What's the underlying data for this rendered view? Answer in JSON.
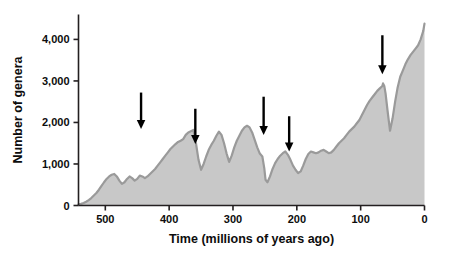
{
  "chart_data": {
    "type": "area",
    "title": "",
    "xlabel": "Time (millions of years ago)",
    "ylabel": "Number of genera",
    "xlim": [
      542,
      0
    ],
    "ylim": [
      0,
      4600
    ],
    "x_reversed": true,
    "grid": false,
    "legend": null,
    "x_ticks": [
      500,
      400,
      300,
      200,
      100,
      0
    ],
    "x_tick_labels": [
      "500",
      "400",
      "300",
      "200",
      "100",
      "0"
    ],
    "y_ticks": [
      0,
      1000,
      2000,
      3000,
      4000
    ],
    "y_tick_labels": [
      "0",
      "1,000",
      "2,000",
      "3,000",
      "4,000"
    ],
    "series_name": "Marine animal genera",
    "fill_color": "#c8c8c8",
    "line_color": "#9a9a9a",
    "axis_color": "#231f20",
    "arrow_color": "#000000",
    "x": [
      542,
      538,
      534,
      530,
      526,
      522,
      518,
      514,
      510,
      506,
      502,
      498,
      494,
      490,
      486,
      482,
      478,
      474,
      470,
      466,
      462,
      458,
      454,
      450,
      446,
      442,
      438,
      434,
      430,
      426,
      422,
      418,
      414,
      410,
      406,
      402,
      398,
      394,
      390,
      386,
      382,
      378,
      374,
      370,
      366,
      362,
      358,
      354,
      350,
      346,
      342,
      338,
      334,
      330,
      326,
      322,
      318,
      314,
      310,
      306,
      302,
      298,
      294,
      290,
      286,
      282,
      278,
      274,
      270,
      266,
      262,
      258,
      254,
      251,
      249,
      246,
      242,
      238,
      234,
      230,
      226,
      222,
      218,
      214,
      210,
      206,
      202,
      198,
      194,
      190,
      186,
      182,
      178,
      174,
      170,
      166,
      162,
      158,
      154,
      150,
      146,
      142,
      138,
      134,
      130,
      126,
      122,
      118,
      114,
      110,
      106,
      102,
      98,
      94,
      90,
      86,
      82,
      78,
      74,
      70,
      66,
      65,
      63,
      61,
      58,
      54,
      50,
      46,
      42,
      38,
      34,
      30,
      26,
      22,
      18,
      14,
      10,
      6,
      2,
      0
    ],
    "y": [
      30,
      40,
      60,
      90,
      130,
      180,
      240,
      300,
      380,
      470,
      560,
      640,
      700,
      740,
      760,
      700,
      600,
      520,
      560,
      640,
      700,
      660,
      600,
      640,
      720,
      700,
      660,
      700,
      760,
      820,
      880,
      960,
      1040,
      1120,
      1200,
      1280,
      1360,
      1420,
      1480,
      1530,
      1560,
      1600,
      1700,
      1760,
      1790,
      1820,
      1500,
      1100,
      860,
      1000,
      1180,
      1340,
      1460,
      1560,
      1680,
      1780,
      1700,
      1500,
      1250,
      1050,
      1200,
      1400,
      1560,
      1680,
      1800,
      1880,
      1920,
      1880,
      1760,
      1580,
      1400,
      1250,
      1180,
      900,
      620,
      560,
      700,
      880,
      1020,
      1120,
      1200,
      1260,
      1300,
      1220,
      1100,
      960,
      860,
      780,
      820,
      960,
      1120,
      1240,
      1300,
      1280,
      1260,
      1280,
      1320,
      1340,
      1300,
      1260,
      1280,
      1340,
      1420,
      1500,
      1560,
      1620,
      1700,
      1780,
      1840,
      1900,
      1980,
      2060,
      2180,
      2300,
      2420,
      2520,
      2600,
      2680,
      2760,
      2820,
      2880,
      2940,
      2880,
      2700,
      2300,
      1800,
      2100,
      2500,
      2850,
      3100,
      3250,
      3400,
      3520,
      3620,
      3700,
      3780,
      3860,
      4000,
      4200,
      4380,
      4480,
      4540
    ],
    "annotations": [
      {
        "name": "mass-extinction-end-ordovician",
        "x": 444,
        "label": "",
        "arrow_top_value": 2720,
        "arrow_tip_value": 1840
      },
      {
        "name": "mass-extinction-late-devonian",
        "x": 359,
        "label": "",
        "arrow_top_value": 2330,
        "arrow_tip_value": 1480
      },
      {
        "name": "mass-extinction-end-permian",
        "x": 252,
        "label": "",
        "arrow_top_value": 2620,
        "arrow_tip_value": 1700
      },
      {
        "name": "mass-extinction-end-triassic",
        "x": 212,
        "label": "",
        "arrow_top_value": 2150,
        "arrow_tip_value": 1300
      },
      {
        "name": "mass-extinction-end-cretaceous",
        "x": 66,
        "label": "",
        "arrow_top_value": 4100,
        "arrow_tip_value": 3160
      }
    ]
  }
}
